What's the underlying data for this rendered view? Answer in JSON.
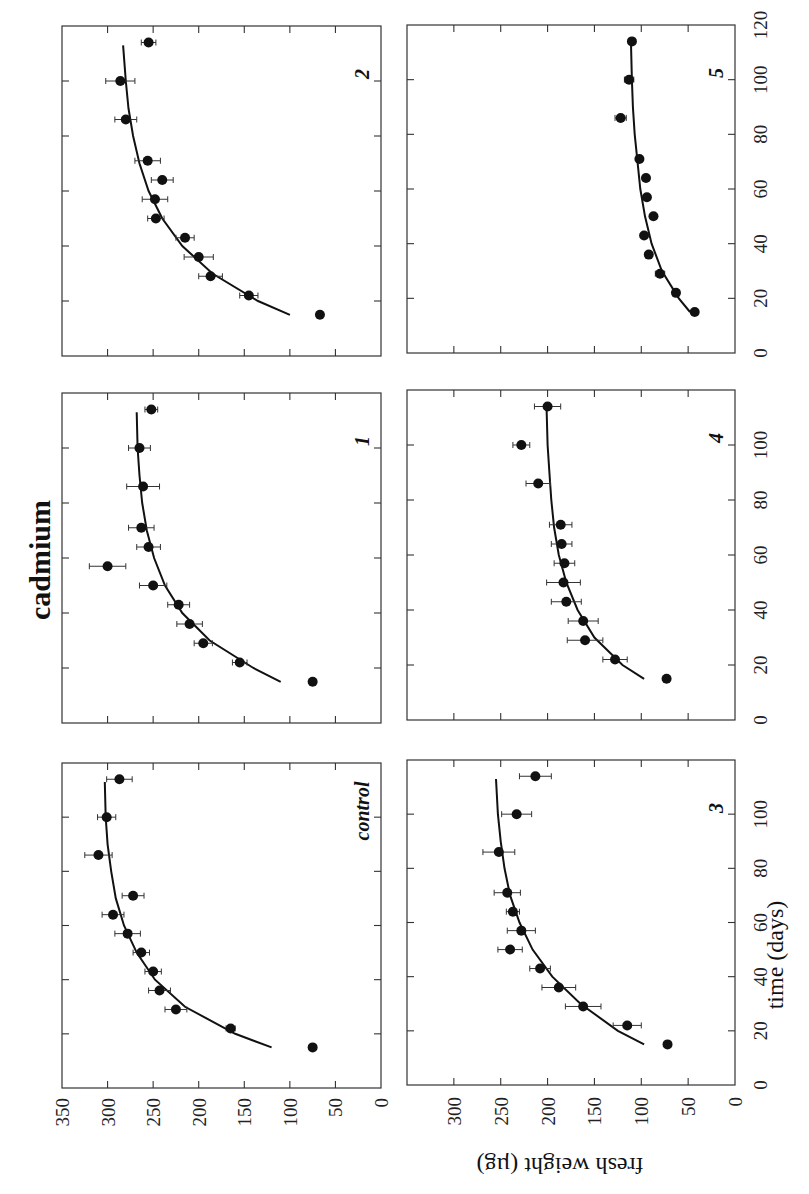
{
  "chart_data": {
    "type": "scatter",
    "title": "cadmium",
    "xlabel": "time (days)",
    "ylabel": "fresh weight (µg)",
    "orientation": "figure rotated 90° counter-clockwise on page",
    "xlim": [
      0,
      120
    ],
    "x_ticks": [
      0,
      20,
      40,
      60,
      80,
      100,
      120
    ],
    "ylim": [
      0,
      350
    ],
    "y_ticks_first_panel": [
      0,
      50,
      100,
      150,
      200,
      250,
      300,
      350
    ],
    "y_ticks_other_panels": [
      0,
      50,
      100,
      150,
      200,
      250,
      300
    ],
    "grid": false,
    "markers": "filled circles with horizontal error bars; solid line = fitted growth curve",
    "panels": [
      {
        "label": "control",
        "x": [
          15,
          22,
          29,
          36,
          43,
          50,
          57,
          64,
          71,
          86,
          100,
          114
        ],
        "y": [
          75,
          165,
          225,
          243,
          250,
          263,
          278,
          294,
          272,
          310,
          301,
          287
        ],
        "err": [
          0,
          5,
          12,
          12,
          9,
          9,
          14,
          12,
          12,
          15,
          10,
          14
        ],
        "fit": {
          "x": [
            15,
            20,
            30,
            40,
            50,
            60,
            70,
            80,
            90,
            100,
            113
          ],
          "y": [
            120,
            160,
            215,
            248,
            268,
            282,
            291,
            296,
            300,
            302,
            303
          ]
        }
      },
      {
        "label": "3",
        "x": [
          15,
          22,
          29,
          36,
          43,
          50,
          57,
          64,
          71,
          86,
          100,
          114
        ],
        "y": [
          72,
          115,
          162,
          188,
          208,
          240,
          228,
          237,
          243,
          252,
          233,
          213
        ],
        "err": [
          0,
          15,
          19,
          18,
          11,
          13,
          15,
          7,
          14,
          17,
          16,
          17
        ],
        "fit": {
          "x": [
            15,
            20,
            30,
            40,
            50,
            60,
            70,
            80,
            90,
            100,
            113
          ],
          "y": [
            97,
            125,
            165,
            195,
            216,
            230,
            240,
            246,
            250,
            253,
            255
          ]
        }
      },
      {
        "label": "1",
        "x": [
          15,
          22,
          29,
          36,
          43,
          50,
          57,
          64,
          71,
          86,
          100,
          114
        ],
        "y": [
          75,
          155,
          195,
          210,
          222,
          250,
          300,
          255,
          263,
          261,
          265,
          252
        ],
        "err": [
          0,
          8,
          10,
          14,
          12,
          15,
          20,
          13,
          14,
          18,
          12,
          7
        ],
        "fit": {
          "x": [
            15,
            20,
            30,
            40,
            50,
            60,
            70,
            80,
            90,
            100,
            113
          ],
          "y": [
            110,
            140,
            188,
            218,
            237,
            249,
            257,
            262,
            265,
            267,
            268
          ]
        }
      },
      {
        "label": "4",
        "x": [
          15,
          22,
          29,
          36,
          43,
          50,
          57,
          64,
          71,
          86,
          100,
          114
        ],
        "y": [
          73,
          128,
          160,
          162,
          180,
          183,
          182,
          185,
          186,
          210,
          228,
          200
        ],
        "err": [
          0,
          13,
          19,
          16,
          16,
          18,
          11,
          11,
          12,
          13,
          9,
          14
        ],
        "fit": {
          "x": [
            15,
            20,
            30,
            40,
            50,
            60,
            70,
            80,
            90,
            100,
            113
          ],
          "y": [
            97,
            120,
            150,
            168,
            180,
            188,
            193,
            196,
            198,
            200,
            201
          ]
        }
      },
      {
        "label": "2",
        "x": [
          15,
          22,
          29,
          36,
          43,
          50,
          57,
          64,
          71,
          86,
          100,
          114
        ],
        "y": [
          67,
          145,
          187,
          200,
          215,
          247,
          248,
          240,
          256,
          280,
          286,
          255
        ],
        "err": [
          0,
          10,
          13,
          16,
          10,
          9,
          14,
          12,
          14,
          12,
          16,
          8
        ],
        "fit": {
          "x": [
            15,
            20,
            30,
            40,
            50,
            60,
            70,
            80,
            90,
            100,
            113
          ],
          "y": [
            100,
            135,
            185,
            218,
            240,
            255,
            265,
            272,
            277,
            280,
            283
          ]
        }
      },
      {
        "label": "5",
        "x": [
          15,
          22,
          29,
          36,
          43,
          50,
          57,
          64,
          71,
          86,
          100,
          114
        ],
        "y": [
          43,
          63,
          80,
          92,
          97,
          87,
          94,
          95,
          102,
          122,
          113,
          110
        ],
        "err": [
          0,
          0,
          5,
          0,
          0,
          0,
          0,
          0,
          0,
          6,
          5,
          0
        ],
        "fit": {
          "x": [
            15,
            20,
            30,
            40,
            50,
            60,
            70,
            80,
            90,
            100,
            113
          ],
          "y": [
            48,
            60,
            78,
            89,
            96,
            101,
            104,
            107,
            109,
            110,
            111
          ]
        }
      }
    ]
  },
  "labels": {
    "title": "cadmium",
    "xlabel": "time (days)",
    "ylabel": "fresh weight (µg)",
    "panel_control": "control",
    "panel_1": "1",
    "panel_2": "2",
    "panel_3": "3",
    "panel_4": "4",
    "panel_5": "5"
  }
}
